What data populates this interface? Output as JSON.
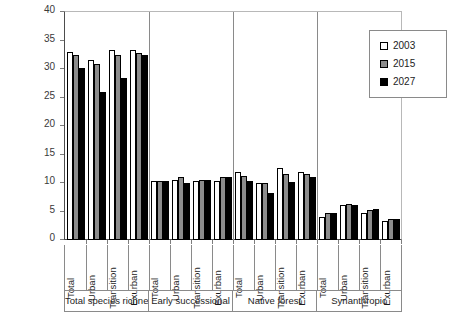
{
  "chart_data": {
    "type": "bar",
    "title": "",
    "xlabel": "",
    "ylabel": "",
    "ylim": [
      0,
      40
    ],
    "ytick_step": 5,
    "yticks": [
      0,
      5,
      10,
      15,
      20,
      25,
      30,
      35,
      40
    ],
    "ytick_labels": [
      "0",
      "5",
      "10",
      "15",
      "20",
      "25",
      "30",
      "35",
      "40"
    ],
    "grid": false,
    "legend_position": "top-right",
    "categories": [
      "Total",
      "Urban",
      "Transition",
      "Exurban"
    ],
    "groups": [
      {
        "name": "Total species richness",
        "categories": [
          "Total",
          "Urban",
          "Transition",
          "Exurban"
        ],
        "series": [
          {
            "name": "2003",
            "values": [
              33.0,
              31.5,
              33.3,
              33.3
            ]
          },
          {
            "name": "2015",
            "values": [
              32.4,
              30.9,
              32.5,
              32.8
            ]
          },
          {
            "name": "2027",
            "values": [
              30.1,
              26.0,
              28.5,
              32.4
            ]
          }
        ]
      },
      {
        "name": "Early successional",
        "categories": [
          "Total",
          "Urban",
          "Transition",
          "Exurban"
        ],
        "series": [
          {
            "name": "2003",
            "values": [
              10.4,
              10.5,
              10.4,
              10.4
            ]
          },
          {
            "name": "2015",
            "values": [
              10.4,
              11.0,
              10.6,
              11.0
            ]
          },
          {
            "name": "2027",
            "values": [
              10.3,
              10.0,
              10.5,
              11.0
            ]
          }
        ]
      },
      {
        "name": "Native forest",
        "categories": [
          "Total",
          "Urban",
          "Transition",
          "Exurban"
        ],
        "series": [
          {
            "name": "2003",
            "values": [
              12.0,
              10.0,
              12.6,
              12.0
            ]
          },
          {
            "name": "2015",
            "values": [
              11.2,
              10.0,
              11.6,
              11.6
            ]
          },
          {
            "name": "2027",
            "values": [
              10.4,
              8.2,
              10.1,
              11.1
            ]
          }
        ]
      },
      {
        "name": "Synanthropic",
        "categories": [
          "Total",
          "Urban",
          "Transition",
          "Exurban"
        ],
        "series": [
          {
            "name": "2003",
            "values": [
              4.1,
              6.1,
              4.8,
              3.4
            ]
          },
          {
            "name": "2015",
            "values": [
              4.7,
              6.4,
              5.2,
              3.7
            ]
          },
          {
            "name": "2027",
            "values": [
              4.7,
              6.1,
              5.4,
              3.6
            ]
          }
        ]
      }
    ],
    "series_colors": {
      "2003": "#ffffff",
      "2015": "#8c8c8c",
      "2027": "#000000"
    }
  },
  "legend": {
    "items": [
      {
        "label": "2003",
        "color": "#ffffff"
      },
      {
        "label": "2015",
        "color": "#8c8c8c"
      },
      {
        "label": "2027",
        "color": "#000000"
      }
    ]
  },
  "axis": {
    "y_labels": [
      "40",
      "35",
      "30",
      "25",
      "20",
      "15",
      "10",
      "5",
      "0"
    ]
  }
}
